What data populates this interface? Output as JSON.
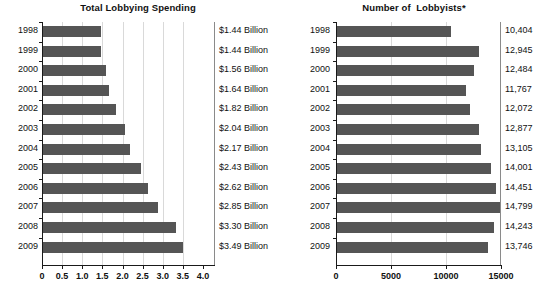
{
  "chart_data": [
    {
      "type": "bar",
      "orientation": "horizontal",
      "title": "Total Lobbying Spending",
      "xlabel": "",
      "ylabel": "",
      "xlim": [
        0,
        4.0
      ],
      "xticks": [
        "0",
        "0.5",
        "1.0",
        "1.5",
        "2.0",
        "2.5",
        "3.0",
        "3.5",
        "4.0"
      ],
      "xtick_values": [
        0,
        0.5,
        1.0,
        1.5,
        2.0,
        2.5,
        3.0,
        3.5,
        4.0
      ],
      "grid": true,
      "legend": "none",
      "categories": [
        "1998",
        "1999",
        "2000",
        "2001",
        "2002",
        "2003",
        "2004",
        "2005",
        "2006",
        "2007",
        "2008",
        "2009"
      ],
      "values": [
        1.44,
        1.44,
        1.56,
        1.64,
        1.82,
        2.04,
        2.17,
        2.43,
        2.62,
        2.85,
        3.3,
        3.49
      ],
      "value_labels": [
        "$1.44 Billion",
        "$1.44 Billion",
        "$1.56 Billion",
        "$1.64 Billion",
        "$1.82 Billion",
        "$2.04 Billion",
        "$2.17 Billion",
        "$2.43 Billion",
        "$2.62 Billion",
        "$2.85 Billion",
        "$3.30 Billion",
        "$3.49 Billion"
      ],
      "bar_color": "#555555"
    },
    {
      "type": "bar",
      "orientation": "horizontal",
      "title": "Number of  Lobbyists*",
      "xlabel": "",
      "ylabel": "",
      "xlim": [
        0,
        15000
      ],
      "xticks": [
        "0",
        "5000",
        "10000",
        "15000"
      ],
      "xtick_values": [
        0,
        5000,
        10000,
        15000
      ],
      "grid": true,
      "legend": "none",
      "categories": [
        "1998",
        "1999",
        "2000",
        "2001",
        "2002",
        "2003",
        "2004",
        "2005",
        "2006",
        "2007",
        "2008",
        "2009"
      ],
      "values": [
        10404,
        12945,
        12484,
        11767,
        12072,
        12877,
        13105,
        14001,
        14451,
        14799,
        14243,
        13746
      ],
      "value_labels": [
        "10,404",
        "12,945",
        "12,484",
        "11,767",
        "12,072",
        "12,877",
        "13,105",
        "14,001",
        "14,451",
        "14,799",
        "14,243",
        "13,746"
      ],
      "bar_color": "#555555"
    }
  ]
}
